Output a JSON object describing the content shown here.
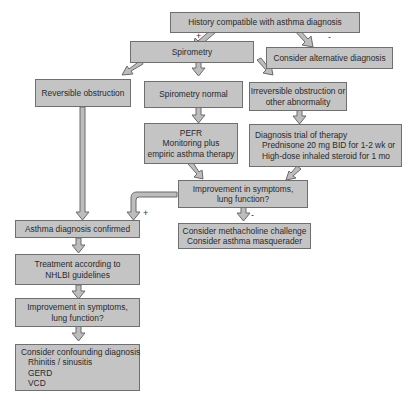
{
  "diagram": {
    "nodes": {
      "history": {
        "lines": [
          "History compatible with asthma diagnosis"
        ]
      },
      "alternative": {
        "lines": [
          "Consider alternative diagnosis"
        ]
      },
      "spirometry": {
        "lines": [
          "Spirometry"
        ]
      },
      "reversible": {
        "lines": [
          "Reversible obstruction"
        ]
      },
      "spiro_normal": {
        "lines": [
          "Spirometry normal"
        ]
      },
      "irreversible": {
        "lines": [
          "Irreversible obstruction or",
          "other abnormality"
        ]
      },
      "pefr": {
        "lines": [
          "PEFR",
          "Monitoring plus",
          "empiric asthma therapy"
        ]
      },
      "trial": {
        "title": "Diagnosis trial of therapy",
        "lines": [
          "Prednisone 20 mg BID for 1-2 wk or",
          "High-dose inhaled steroid for 1 mo"
        ]
      },
      "improve1": {
        "lines": [
          "Improvement in symptoms,",
          "lung function?"
        ]
      },
      "methacholine": {
        "lines": [
          "Consider methacholine challenge",
          "Consider asthma masquerader"
        ]
      },
      "confirmed": {
        "lines": [
          "Asthma diagnosis confirmed"
        ]
      },
      "treatment": {
        "lines": [
          "Treatment according to",
          "NHLBI guidelines"
        ]
      },
      "improve2": {
        "lines": [
          "Improvement in symptoms,",
          "lung function?"
        ]
      },
      "confounding": {
        "title": "Consider confounding diagnosis",
        "lines": [
          "Rhinitis / sinusitis",
          "GERD",
          "VCD"
        ]
      }
    },
    "labels": {
      "history_plus": "+",
      "history_minus": "-",
      "improve1_plus": "+",
      "improve1_minus": "-"
    },
    "colors": {
      "box_fill": "#c4c4c4",
      "box_border": "#6f6f6f",
      "arrow_fill": "#bdbdbd",
      "arrow_stroke": "#6a6a6a"
    }
  }
}
